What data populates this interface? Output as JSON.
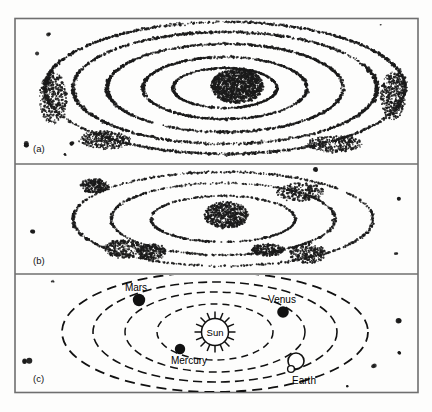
{
  "figure": {
    "caption_visible": false,
    "background_color": "#fdfdfc",
    "ink_color": "#1a1a1a",
    "frame_color": "#6f6f6f",
    "panels": [
      {
        "id": "a",
        "label": "(a)",
        "description": "dense stippled elliptical orbital rings with concentrated central core",
        "stipple_density": "high"
      },
      {
        "id": "b",
        "label": "(b)",
        "description": "sparse clumped stippled elliptical rings with compact central cluster",
        "stipple_density": "medium"
      },
      {
        "id": "c",
        "label": "(c)",
        "description": "schematic solar system with four dashed orbital ellipses and labelled bodies",
        "stipple_density": "low"
      }
    ]
  },
  "solar_system": {
    "center_body": {
      "name": "Sun",
      "label": "Sun",
      "style": "open-circle-with-rays",
      "ray_count": 16
    },
    "planets": [
      {
        "name": "Mercury",
        "label": "Mercury",
        "orbit_index": 1,
        "marker": "filled-dot",
        "marker_size": 6,
        "label_position": "below"
      },
      {
        "name": "Venus",
        "label": "Venus",
        "orbit_index": 2,
        "marker": "filled-dot",
        "marker_size": 7,
        "label_position": "above"
      },
      {
        "name": "Earth",
        "label": "Earth",
        "orbit_index": 3,
        "marker": "open-circle",
        "marker_size": 8,
        "label_position": "below"
      },
      {
        "name": "Mars",
        "label": "Mars",
        "orbit_index": 4,
        "marker": "filled-dot",
        "marker_size": 7,
        "label_position": "above"
      }
    ],
    "orbits": {
      "count": 4,
      "style": "dashed",
      "shape": "ellipse"
    }
  },
  "chart_data": {
    "type": "scatter",
    "title": "",
    "xlabel": "",
    "ylabel": "",
    "panels": [
      {
        "id": "a",
        "label": "(a)",
        "series": [
          {
            "name": "central-core",
            "cx": 0.52,
            "cy": 0.5,
            "rx": 0.11,
            "ry": 0.13,
            "points": 900
          },
          {
            "name": "ring-1",
            "rx": 0.14,
            "ry": 0.085,
            "points": 230
          },
          {
            "name": "ring-2",
            "rx": 0.21,
            "ry": 0.13,
            "points": 300
          },
          {
            "name": "ring-3",
            "rx": 0.3,
            "ry": 0.185,
            "points": 380
          },
          {
            "name": "ring-4",
            "rx": 0.395,
            "ry": 0.255,
            "points": 460
          },
          {
            "name": "ring-5",
            "rx": 0.465,
            "ry": 0.325,
            "points": 520
          },
          {
            "name": "field-specks",
            "points": 28
          }
        ]
      },
      {
        "id": "b",
        "label": "(b)",
        "series": [
          {
            "name": "central-core",
            "cx": 0.51,
            "cy": 0.5,
            "rx": 0.085,
            "ry": 0.105,
            "points": 420
          },
          {
            "name": "ring-1",
            "rx": 0.175,
            "ry": 0.115,
            "points": 150
          },
          {
            "name": "ring-2",
            "rx": 0.275,
            "ry": 0.195,
            "points": 210
          },
          {
            "name": "ring-3",
            "rx": 0.375,
            "ry": 0.28,
            "points": 250
          },
          {
            "name": "clumps",
            "points": 6
          },
          {
            "name": "field-specks",
            "points": 22
          }
        ]
      },
      {
        "id": "c",
        "label": "(c)",
        "series": [
          {
            "name": "orbit-mercury",
            "rx": 0.145,
            "ry": 0.255
          },
          {
            "name": "orbit-venus",
            "rx": 0.225,
            "ry": 0.41
          },
          {
            "name": "orbit-earth",
            "rx": 0.305,
            "ry": 0.56
          },
          {
            "name": "orbit-mars",
            "rx": 0.385,
            "ry": 0.7
          },
          {
            "name": "field-specks",
            "points": 26
          }
        ]
      }
    ]
  }
}
